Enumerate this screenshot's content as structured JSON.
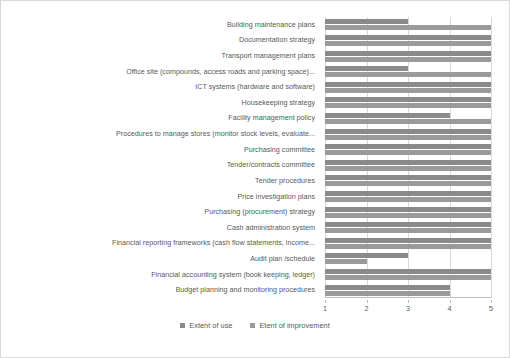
{
  "chart_data": {
    "type": "bar",
    "orientation": "horizontal",
    "title": "",
    "xlabel": "",
    "ylabel": "",
    "xlim": [
      1,
      5
    ],
    "xticks": [
      1,
      2,
      3,
      4,
      5
    ],
    "grid": true,
    "legend_position": "bottom",
    "categories": [
      "Building maintenance plans",
      "Documentation strategy",
      "Transport management plans",
      "Office site (compounds, access roads and parking space)...",
      "ICT systems (hardware and software)",
      "Housekeeping strategy",
      "Facility management policy",
      "Procedures to manage stores (monitor stock levels, evaluate...",
      "Purchasing committee",
      "Tender/contracts committee",
      "Tender procedures",
      "Price investigation plans",
      "Purchasing (procurement) strategy",
      "Cash administration system",
      "Financial reporting frameworks (cash flow statements, income...",
      "Audit plan /schedule",
      "Financial accounting system (book keeping, ledger)",
      "Budget planning and monitoring procedures"
    ],
    "series": [
      {
        "name": "Extent of use",
        "color": "#8a8a8a",
        "values": [
          3,
          5,
          5,
          3,
          5,
          5,
          4,
          5,
          5,
          5,
          5,
          5,
          5,
          5,
          5,
          3,
          5,
          4
        ]
      },
      {
        "name": "Etent of improvement",
        "color": "#9a9a9a",
        "values": [
          5,
          5,
          5,
          5,
          5,
          5,
          5,
          5,
          5,
          5,
          5,
          5,
          5,
          5,
          5,
          2,
          5,
          4
        ]
      }
    ]
  },
  "legend": {
    "items": [
      {
        "label": "Extent of use",
        "color": "#8a8a8a"
      },
      {
        "label": "Etent of improvement",
        "color": "#9a9a9a"
      }
    ]
  }
}
